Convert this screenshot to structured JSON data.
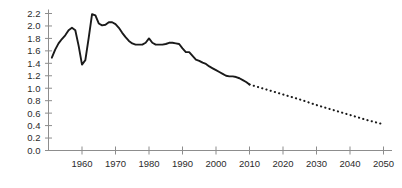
{
  "chart_data": {
    "type": "line",
    "title": "",
    "subtitle": "",
    "xlabel": "",
    "ylabel": "",
    "xlim": [
      1951,
      2052
    ],
    "ylim": [
      0.0,
      2.2
    ],
    "grid": false,
    "legend": null,
    "y_ticks": [
      "0.0",
      "0.2",
      "0.4",
      "0.6",
      "0.8",
      "1.0",
      "1.2",
      "1.4",
      "1.6",
      "1.8",
      "2.0",
      "2.2"
    ],
    "y_tick_values": [
      0.0,
      0.2,
      0.4,
      0.6,
      0.8,
      1.0,
      1.2,
      1.4,
      1.6,
      1.8,
      2.0,
      2.2
    ],
    "x_ticks": [
      "1960",
      "1970",
      "1980",
      "1990",
      "2000",
      "2010",
      "2020",
      "2030",
      "2040",
      "2050"
    ],
    "x_tick_values": [
      1960,
      1970,
      1980,
      1990,
      2000,
      2010,
      2020,
      2030,
      2040,
      2050
    ],
    "series": [
      {
        "name": "historical",
        "style": "solid",
        "color": "#1a1a1a",
        "x": [
          1951,
          1952,
          1953,
          1954,
          1955,
          1956,
          1957,
          1958,
          1959,
          1960,
          1961,
          1962,
          1963,
          1964,
          1965,
          1966,
          1967,
          1968,
          1969,
          1970,
          1971,
          1972,
          1973,
          1974,
          1975,
          1976,
          1977,
          1978,
          1979,
          1980,
          1981,
          1982,
          1983,
          1984,
          1985,
          1986,
          1987,
          1988,
          1989,
          1990,
          1991,
          1992,
          1993,
          1994,
          1995,
          1996,
          1997,
          1998,
          1999,
          2000,
          2001,
          2002,
          2003,
          2004,
          2005,
          2006,
          2007,
          2008,
          2009,
          2010
        ],
        "values": [
          1.49,
          1.62,
          1.72,
          1.79,
          1.85,
          1.93,
          1.97,
          1.93,
          1.68,
          1.38,
          1.45,
          1.81,
          2.19,
          2.17,
          2.04,
          2.01,
          2.02,
          2.06,
          2.06,
          2.03,
          1.97,
          1.89,
          1.82,
          1.76,
          1.72,
          1.7,
          1.7,
          1.7,
          1.73,
          1.8,
          1.73,
          1.7,
          1.7,
          1.7,
          1.71,
          1.73,
          1.73,
          1.72,
          1.71,
          1.64,
          1.58,
          1.58,
          1.52,
          1.46,
          1.44,
          1.41,
          1.39,
          1.35,
          1.32,
          1.29,
          1.26,
          1.23,
          1.2,
          1.19,
          1.19,
          1.18,
          1.16,
          1.13,
          1.1,
          1.06
        ]
      },
      {
        "name": "projection",
        "style": "dotted",
        "color": "#1a1a1a",
        "x": [
          2010,
          2015,
          2020,
          2025,
          2030,
          2035,
          2040,
          2045,
          2050
        ],
        "values": [
          1.06,
          0.98,
          0.9,
          0.82,
          0.73,
          0.65,
          0.57,
          0.49,
          0.42
        ]
      }
    ],
    "annotations": []
  }
}
